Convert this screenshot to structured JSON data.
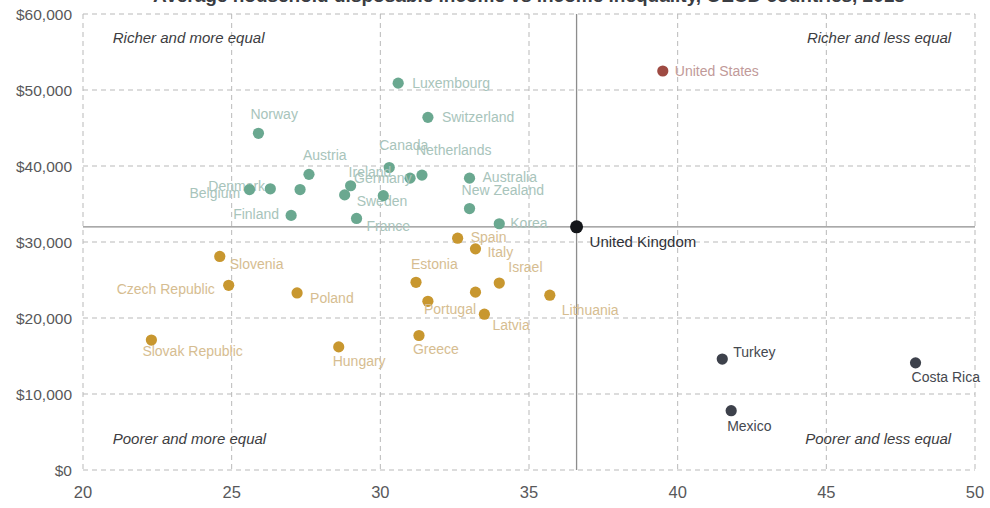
{
  "chart_data": {
    "type": "scatter",
    "title": "Average household disposable income vs income inequality, OECD countries, 2018",
    "xlabel": "",
    "ylabel": "",
    "xlim": [
      20,
      50
    ],
    "ylim": [
      0,
      60000
    ],
    "xticks": [
      "20",
      "25",
      "30",
      "35",
      "40",
      "45",
      "50"
    ],
    "xtick_values": [
      20,
      25,
      30,
      35,
      40,
      45,
      50
    ],
    "yticks": [
      "$0",
      "$10,000",
      "$20,000",
      "$30,000",
      "$40,000",
      "$50,000",
      "$60,000"
    ],
    "ytick_values": [
      0,
      10000,
      20000,
      30000,
      40000,
      50000,
      60000
    ],
    "grid": "dashed",
    "legend_position": "none",
    "reference_lines": {
      "x": 36.6,
      "y": 32000,
      "label": "United Kingdom"
    },
    "annotations": [
      {
        "text": "Richer and more equal",
        "x": 21.0,
        "y": 56200,
        "align": "start"
      },
      {
        "text": "Richer and less equal",
        "x": 49.2,
        "y": 56200,
        "align": "end"
      },
      {
        "text": "Poorer and more equal",
        "x": 21.0,
        "y": 3400,
        "align": "start"
      },
      {
        "text": "Poorer and less equal",
        "x": 49.2,
        "y": 3400,
        "align": "end"
      }
    ],
    "colors": {
      "green": "#6aa890",
      "orange": "#c8972f",
      "dark": "#3d414b",
      "red": "#9e4a42",
      "grid": "#b9b9b9",
      "reference": "#8d8d8d",
      "axis_text": "#58585a"
    },
    "series": [
      {
        "name": "Richer countries",
        "color": "#6aa890",
        "label_color": "#a8c4bb",
        "points": [
          {
            "label": "Luxembourg",
            "x": 30.6,
            "y": 50900,
            "lx": 14,
            "ly": 5
          },
          {
            "label": "Switzerland",
            "x": 31.6,
            "y": 46400,
            "lx": 14,
            "ly": 5
          },
          {
            "label": "Norway",
            "x": 25.9,
            "y": 44300,
            "lx": -8,
            "ly": -14
          },
          {
            "label": "Canada",
            "x": 30.3,
            "y": 39800,
            "lx": -10,
            "ly": -18
          },
          {
            "label": "Austria",
            "x": 27.6,
            "y": 38900,
            "lx": -6,
            "ly": -14
          },
          {
            "label": "Netherlands",
            "x": 31.4,
            "y": 38800,
            "lx": -6,
            "ly": -20
          },
          {
            "label": "Australia",
            "x": 33.0,
            "y": 38400,
            "lx": 13,
            "ly": 4
          },
          {
            "label": "Germany",
            "x": 31.0,
            "y": 38400,
            "lx": -56,
            "ly": 5
          },
          {
            "label": "Denmark",
            "x": 26.3,
            "y": 37000,
            "lx": -62,
            "ly": 2
          },
          {
            "label": "Ireland",
            "x": 29.0,
            "y": 37400,
            "lx": -2,
            "ly": -9
          },
          {
            "label": "Belgium",
            "x": 25.6,
            "y": 36900,
            "lx": -60,
            "ly": 8
          },
          {
            "label": "Sweden",
            "x": 28.8,
            "y": 36200,
            "lx": 12,
            "ly": 11
          },
          {
            "label": "New Zealand",
            "x": 33.0,
            "y": 34400,
            "lx": -8,
            "ly": -14
          },
          {
            "label": "Finland",
            "x": 27.0,
            "y": 33500,
            "lx": -58,
            "ly": 4
          },
          {
            "label": "France",
            "x": 29.2,
            "y": 33100,
            "lx": 10,
            "ly": 13
          },
          {
            "label": "Korea",
            "x": 34.0,
            "y": 32400,
            "lx": 11,
            "ly": 4
          },
          {
            "label": "",
            "x": 27.3,
            "y": 36900,
            "lx": 0,
            "ly": 0
          },
          {
            "label": "",
            "x": 30.1,
            "y": 36100,
            "lx": 0,
            "ly": 0
          }
        ]
      },
      {
        "name": "Middle income countries",
        "color": "#c8972f",
        "label_color": "#d6bd91",
        "points": [
          {
            "label": "Spain",
            "x": 32.6,
            "y": 30500,
            "lx": 13,
            "ly": 4
          },
          {
            "label": "Italy",
            "x": 33.2,
            "y": 29100,
            "lx": 12,
            "ly": 8
          },
          {
            "label": "Slovenia",
            "x": 24.6,
            "y": 28100,
            "lx": 10,
            "ly": 13
          },
          {
            "label": "Estonia",
            "x": 31.2,
            "y": 24700,
            "lx": -5,
            "ly": -13
          },
          {
            "label": "Israel",
            "x": 34.0,
            "y": 24600,
            "lx": 9,
            "ly": -11
          },
          {
            "label": "Czech Republic",
            "x": 24.9,
            "y": 24300,
            "lx": -112,
            "ly": 9
          },
          {
            "label": "Poland",
            "x": 27.2,
            "y": 23300,
            "lx": 13,
            "ly": 10
          },
          {
            "label": "Portugal",
            "x": 31.6,
            "y": 22200,
            "lx": -4,
            "ly": 13
          },
          {
            "label": "Lithuania",
            "x": 35.7,
            "y": 23000,
            "lx": 12,
            "ly": 20
          },
          {
            "label": "Latvia",
            "x": 33.5,
            "y": 20500,
            "lx": 8,
            "ly": 16
          },
          {
            "label": "Slovak Republic",
            "x": 22.3,
            "y": 17100,
            "lx": -9,
            "ly": 16
          },
          {
            "label": "Greece",
            "x": 31.3,
            "y": 17700,
            "lx": -6,
            "ly": 19
          },
          {
            "label": "Hungary",
            "x": 28.6,
            "y": 16200,
            "lx": -6,
            "ly": 19
          },
          {
            "label": "",
            "x": 33.2,
            "y": 23400,
            "lx": 0,
            "ly": 0
          }
        ]
      },
      {
        "name": "Poorer countries",
        "color": "#3d414b",
        "label_color": "#45484f",
        "points": [
          {
            "label": "Turkey",
            "x": 41.5,
            "y": 14600,
            "lx": 11,
            "ly": -2
          },
          {
            "label": "Costa Rica",
            "x": 48.0,
            "y": 14100,
            "lx": -4,
            "ly": 19
          },
          {
            "label": "Mexico",
            "x": 41.8,
            "y": 7800,
            "lx": -4,
            "ly": 20
          }
        ]
      },
      {
        "name": "United States",
        "color": "#9e4a42",
        "label_color": "#c19a99",
        "points": [
          {
            "label": "United States",
            "x": 39.5,
            "y": 52500,
            "lx": 12,
            "ly": 5
          }
        ]
      },
      {
        "name": "United Kingdom",
        "color": "#14161a",
        "label_color": "#2f3138",
        "points": [
          {
            "label": "United Kingdom",
            "x": 36.6,
            "y": 32000,
            "lx": 13,
            "ly": 20
          }
        ]
      }
    ]
  }
}
